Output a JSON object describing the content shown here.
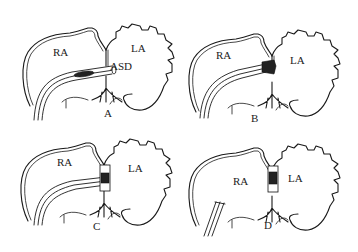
{
  "figure": {
    "panels": [
      {
        "id": "A",
        "label": "A",
        "chambers": {
          "right": "RA",
          "left": "LA"
        },
        "annotation": "ASD"
      },
      {
        "id": "B",
        "label": "B",
        "chambers": {
          "right": "RA",
          "left": "LA"
        }
      },
      {
        "id": "C",
        "label": "C",
        "chambers": {
          "right": "RA",
          "left": "LA"
        }
      },
      {
        "id": "D",
        "label": "D",
        "chambers": {
          "right": "RA",
          "left": "LA"
        }
      }
    ],
    "colors": {
      "line": "#1a1a1a",
      "background": "#ffffff"
    }
  }
}
